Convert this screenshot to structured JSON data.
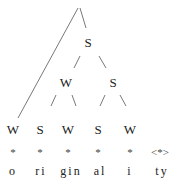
{
  "tree": {
    "upper_nodes": [
      {
        "label": "S",
        "x": 88,
        "y": 42
      },
      {
        "label": "W",
        "x": 66,
        "y": 82
      },
      {
        "label": "S",
        "x": 113,
        "y": 82
      }
    ],
    "terminals": [
      {
        "label": "W",
        "x": 13
      },
      {
        "label": "S",
        "x": 40
      },
      {
        "label": "W",
        "x": 68
      },
      {
        "label": "S",
        "x": 98
      },
      {
        "label": "W",
        "x": 130
      }
    ],
    "grid_marks": [
      "*",
      "*",
      "*",
      "*",
      "*",
      "<*>"
    ],
    "syllables": [
      "o",
      "ri",
      "gin",
      "al",
      "i",
      "ty"
    ]
  }
}
